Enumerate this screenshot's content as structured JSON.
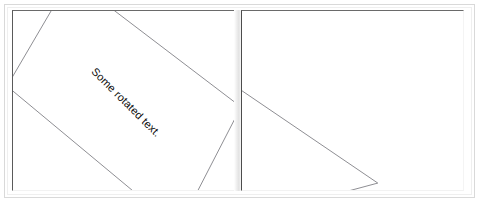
{
  "window": {
    "background_color": "#ffffff",
    "frame_color": "#d9d9d9"
  },
  "panels": [
    {
      "id": "left-page",
      "name": "page-1",
      "text": "Some rotated text.",
      "text_rotation_deg": 45,
      "shape": "rotated-rectangle",
      "shape_stroke_color": "#8d8d92",
      "clipped": false
    },
    {
      "id": "right-page",
      "name": "page-2",
      "text": "Some rotated text.",
      "text_rotation_deg": 45,
      "shape": "rotated-rectangle",
      "shape_stroke_color": "#8d8d92",
      "clipped": true
    }
  ],
  "divider": {
    "label": "page-gutter",
    "color": "#e2e2e2"
  }
}
